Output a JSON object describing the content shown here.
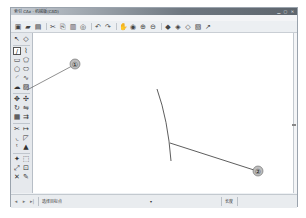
{
  "window": {
    "title": "索引 CAx - 机械版(CAD)",
    "controls": [
      "minimize",
      "maximize",
      "close"
    ]
  },
  "menubar": {
    "items": [
      "文件(F)",
      "编辑(E)",
      "视图(V)",
      "格式(O)",
      "绘图(D)",
      "工具(T)",
      "标注(N)",
      "扩展(X)",
      "窗口(W)",
      "帮助(H)"
    ]
  },
  "toolbar": {
    "buttons": [
      {
        "name": "new-file-icon",
        "glyph": "▣"
      },
      {
        "name": "open-folder-icon",
        "glyph": "▰"
      },
      {
        "name": "save-icon",
        "glyph": "▤"
      },
      {
        "name": "cut-icon",
        "glyph": "✂"
      },
      {
        "name": "copy-icon",
        "glyph": "⎘"
      },
      {
        "name": "paste-icon",
        "glyph": "▥"
      },
      {
        "name": "match-properties-icon",
        "glyph": "◎"
      },
      {
        "name": "undo-icon",
        "glyph": "↶"
      },
      {
        "name": "redo-icon",
        "glyph": "↷"
      },
      {
        "name": "pan-icon",
        "glyph": "✋"
      },
      {
        "name": "zoom-realtime-icon",
        "glyph": "◉"
      },
      {
        "name": "zoom-window-icon",
        "glyph": "⊕"
      },
      {
        "name": "zoom-previous-icon",
        "glyph": "⊖"
      },
      {
        "name": "properties-icon",
        "glyph": "◆"
      },
      {
        "name": "design-center-icon",
        "glyph": "◈"
      },
      {
        "name": "tool-palette-icon",
        "glyph": "◇"
      },
      {
        "name": "layer-icon",
        "glyph": "▧"
      },
      {
        "name": "help-icon",
        "glyph": "↗"
      }
    ]
  },
  "leftbar": {
    "tools": [
      {
        "name": "select-arrow-icon",
        "glyph": "↖"
      },
      {
        "name": "eraser-icon",
        "glyph": "◇"
      },
      {
        "name": "line-tool-icon",
        "glyph": "∕",
        "active": true
      },
      {
        "name": "polyline-tool-icon",
        "glyph": "⌇"
      },
      {
        "name": "rectangle-tool-icon",
        "glyph": "▭"
      },
      {
        "name": "polygon-tool-icon",
        "glyph": "⬠"
      },
      {
        "name": "circle-tool-icon",
        "glyph": "○"
      },
      {
        "name": "ellipse-tool-icon",
        "glyph": "⬭"
      },
      {
        "name": "arc-tool-icon",
        "glyph": "◜"
      },
      {
        "name": "spline-tool-icon",
        "glyph": "∿"
      },
      {
        "name": "revcloud-tool-icon",
        "glyph": "☁"
      },
      {
        "name": "hatch-tool-icon",
        "glyph": "▨"
      },
      {
        "name": "move-tool-icon",
        "glyph": "✥"
      },
      {
        "name": "copy-tool-icon",
        "glyph": "✣"
      },
      {
        "name": "rotate-tool-icon",
        "glyph": "↻"
      },
      {
        "name": "mirror-tool-icon",
        "glyph": "⇋"
      },
      {
        "name": "array-tool-icon",
        "glyph": "▦"
      },
      {
        "name": "offset-tool-icon",
        "glyph": "⇉"
      },
      {
        "name": "trim-tool-icon",
        "glyph": "✂"
      },
      {
        "name": "extend-tool-icon",
        "glyph": "↦"
      },
      {
        "name": "fillet-tool-icon",
        "glyph": "◟"
      },
      {
        "name": "chamfer-tool-icon",
        "glyph": "◸"
      },
      {
        "name": "text-tool-icon",
        "glyph": "ᵗ"
      },
      {
        "name": "dimension-tool-icon",
        "glyph": "▲"
      },
      {
        "name": "explode-tool-icon",
        "glyph": "✦"
      },
      {
        "name": "block-tool-icon",
        "glyph": "⬚"
      },
      {
        "name": "stretch-tool-icon",
        "glyph": "⤢"
      },
      {
        "name": "scale-tool-icon",
        "glyph": "⊡"
      },
      {
        "name": "delete-tool-icon",
        "glyph": "✕"
      },
      {
        "name": "match-tool-icon",
        "glyph": "✎"
      }
    ]
  },
  "callouts": [
    {
      "label": "①",
      "target": "line-tool"
    },
    {
      "label": "②",
      "target": "drawn-line-end"
    }
  ],
  "statusbar": {
    "nav": [
      "◂",
      "▸",
      "▸|"
    ],
    "prompt": "选择目标点",
    "center": "▾",
    "right_label": "长度"
  }
}
